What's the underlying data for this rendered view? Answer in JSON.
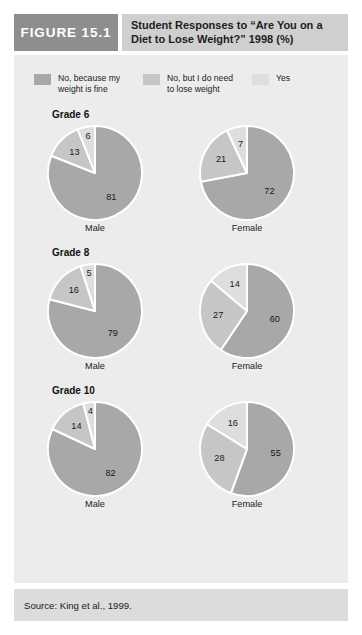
{
  "figure": {
    "badge_label": "FIGURE 15.1",
    "title": "Student Responses to “Are You on a Diet to Lose Weight?” 1998 (%)",
    "source_label": "Source: King et al., 1999."
  },
  "colors": {
    "badge_bg": "#8e8e8e",
    "title_bg": "#cfcfcf",
    "panel_bg": "#ececec",
    "footer_bg": "#dcdcdc",
    "slice_no_weight_fine": "#a8a8a8",
    "slice_no_but_need": "#c6c6c6",
    "slice_yes": "#dedede",
    "slice_divider": "#ffffff"
  },
  "legend": {
    "items": [
      {
        "label": "No, because my weight is fine",
        "color": "#a8a8a8"
      },
      {
        "label": "No, but I do need to lose weight",
        "color": "#c6c6c6"
      },
      {
        "label": "Yes",
        "color": "#dedede"
      }
    ]
  },
  "chart_data": {
    "type": "pie",
    "title": "Student Responses to “Are You on a Diet to Lose Weight?” 1998 (%)",
    "source": "King et al., 1999.",
    "unit": "percent",
    "categories": [
      "No, because my weight is fine",
      "No, but I do need to lose weight",
      "Yes"
    ],
    "category_colors": [
      "#a8a8a8",
      "#c6c6c6",
      "#dedede"
    ],
    "legend_position": "top",
    "grid": false,
    "groups": [
      {
        "grade_label": "Grade 6",
        "pies": [
          {
            "caption": "Male",
            "values": [
              81,
              13,
              6
            ]
          },
          {
            "caption": "Female",
            "values": [
              72,
              21,
              7
            ]
          }
        ]
      },
      {
        "grade_label": "Grade 8",
        "pies": [
          {
            "caption": "Male",
            "values": [
              79,
              16,
              5
            ]
          },
          {
            "caption": "Female",
            "values": [
              60,
              27,
              14
            ]
          }
        ]
      },
      {
        "grade_label": "Grade 10",
        "pies": [
          {
            "caption": "Male",
            "values": [
              82,
              14,
              4
            ]
          },
          {
            "caption": "Female",
            "values": [
              55,
              28,
              16
            ]
          }
        ]
      }
    ]
  }
}
